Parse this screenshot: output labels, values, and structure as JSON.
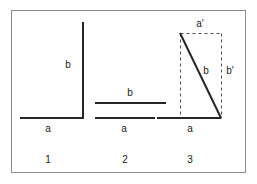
{
  "figure": {
    "canvas": {
      "width": 257,
      "height": 184,
      "background": "#ffffff"
    },
    "frame": {
      "name": "outer-border",
      "x": 11,
      "y": 10,
      "width": 234,
      "height": 162,
      "stroke": "#8c8c8c",
      "stroke_width": 1,
      "fill": "#ffffff"
    },
    "style": {
      "solid_stroke": "#262626",
      "solid_width": 2,
      "dashed_stroke": "#4d4d4d",
      "dashed_width": 1,
      "dash_pattern": "3,3",
      "label_color": "#1a1a1a",
      "label_size_px": 10
    },
    "panels": [
      {
        "id": "panel-1",
        "number": "1",
        "number_pos": {
          "x": 48,
          "y": 155
        },
        "solid_lines": [
          {
            "name": "vector-a-horizontal",
            "x1": 20,
            "y1": 118,
            "x2": 83,
            "y2": 118
          },
          {
            "name": "vector-b-vertical",
            "x1": 83,
            "y1": 22,
            "x2": 83,
            "y2": 119
          }
        ],
        "dashed_lines": [],
        "labels": [
          {
            "name": "label-b",
            "text": "b",
            "x": 68,
            "y": 60
          },
          {
            "name": "label-a",
            "text": "a",
            "x": 48,
            "y": 124
          }
        ]
      },
      {
        "id": "panel-2",
        "number": "2",
        "number_pos": {
          "x": 125,
          "y": 155
        },
        "solid_lines": [
          {
            "name": "vector-b-horizontal",
            "x1": 95,
            "y1": 103,
            "x2": 166,
            "y2": 103
          },
          {
            "name": "vector-a-horizontal",
            "x1": 95,
            "y1": 118,
            "x2": 155,
            "y2": 118
          }
        ],
        "dashed_lines": [],
        "labels": [
          {
            "name": "label-b",
            "text": "b",
            "x": 130,
            "y": 88
          },
          {
            "name": "label-a",
            "text": "a",
            "x": 124,
            "y": 124
          }
        ]
      },
      {
        "id": "panel-3",
        "number": "3",
        "number_pos": {
          "x": 190,
          "y": 155
        },
        "solid_lines": [
          {
            "name": "vector-a-horizontal",
            "x1": 157,
            "y1": 118,
            "x2": 221,
            "y2": 118
          },
          {
            "name": "vector-b-diagonal",
            "x1": 180,
            "y1": 33,
            "x2": 221,
            "y2": 118
          }
        ],
        "dashed_lines": [
          {
            "name": "construction-rect-top",
            "x1": 180,
            "y1": 33,
            "x2": 221,
            "y2": 33
          },
          {
            "name": "construction-rect-left",
            "x1": 180,
            "y1": 33,
            "x2": 180,
            "y2": 118
          },
          {
            "name": "construction-rect-right",
            "x1": 221,
            "y1": 33,
            "x2": 221,
            "y2": 118
          }
        ],
        "labels": [
          {
            "name": "label-a-prime",
            "text": "a′",
            "x": 200,
            "y": 19
          },
          {
            "name": "label-b-diagonal",
            "text": "b",
            "x": 206,
            "y": 66
          },
          {
            "name": "label-b-prime",
            "text": "b′",
            "x": 230,
            "y": 66
          },
          {
            "name": "label-a",
            "text": "a",
            "x": 190,
            "y": 124
          }
        ]
      }
    ]
  }
}
